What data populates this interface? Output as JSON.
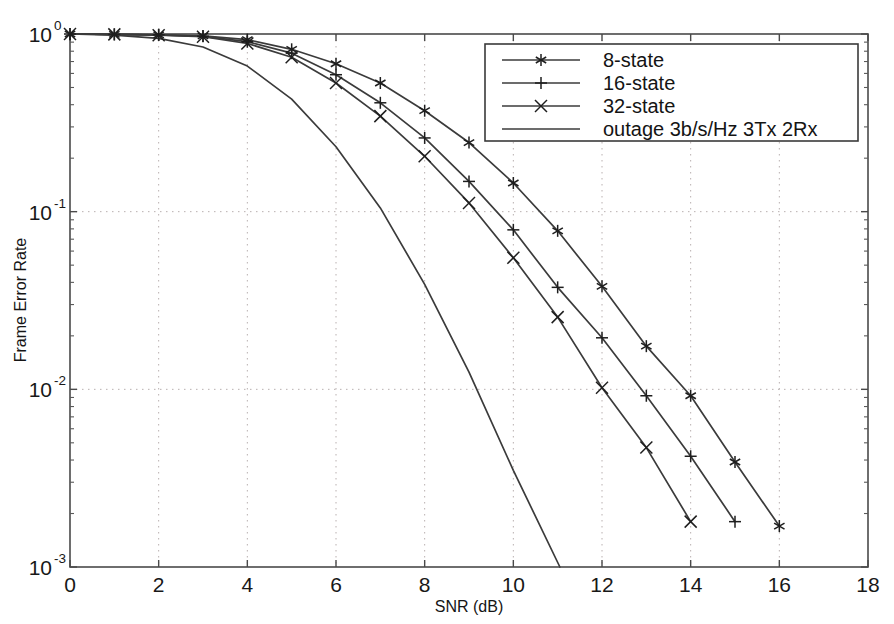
{
  "chart_data": {
    "type": "line",
    "title": "",
    "xlabel": "SNR (dB)",
    "ylabel": "Frame Error Rate",
    "xlim": [
      0,
      18
    ],
    "ylim": [
      0.001,
      1
    ],
    "yscale": "log",
    "grid": true,
    "legend_position": "upper right",
    "xticks": [
      0,
      2,
      4,
      6,
      8,
      10,
      12,
      14,
      16,
      18
    ],
    "xticklabels": [
      "0",
      "2",
      "4",
      "6",
      "8",
      "10",
      "12",
      "14",
      "16",
      "18"
    ],
    "yticks": [
      1,
      0.1,
      0.01,
      0.001
    ],
    "yticklabels": [
      "10^0",
      "10^-1",
      "10^-2",
      "10^-3"
    ],
    "ytick_mantissa": [
      "10",
      "10",
      "10",
      "10"
    ],
    "ytick_exponent": [
      "0",
      "-1",
      "-2",
      "-3"
    ],
    "series": [
      {
        "name": "8-state",
        "marker": "asterisk",
        "x": [
          0,
          1,
          2,
          3,
          4,
          5,
          6,
          7,
          8,
          9,
          10,
          11,
          12,
          13,
          14,
          15,
          16
        ],
        "values": [
          1.0,
          0.995,
          0.99,
          0.975,
          0.93,
          0.82,
          0.68,
          0.53,
          0.37,
          0.245,
          0.145,
          0.078,
          0.038,
          0.0175,
          0.0092,
          0.0039,
          0.0017
        ]
      },
      {
        "name": "16-state",
        "marker": "plus",
        "x": [
          0,
          1,
          2,
          3,
          4,
          5,
          6,
          7,
          8,
          9,
          10,
          11,
          12,
          13,
          14,
          15
        ],
        "values": [
          1.0,
          0.995,
          0.99,
          0.97,
          0.905,
          0.78,
          0.59,
          0.41,
          0.26,
          0.148,
          0.079,
          0.0375,
          0.0195,
          0.0092,
          0.0042,
          0.0018
        ]
      },
      {
        "name": "32-state",
        "marker": "cross",
        "x": [
          0,
          1,
          2,
          3,
          4,
          5,
          6,
          7,
          8,
          9,
          10,
          11,
          12,
          13,
          14
        ],
        "values": [
          1.0,
          0.995,
          0.985,
          0.965,
          0.885,
          0.74,
          0.53,
          0.345,
          0.205,
          0.112,
          0.055,
          0.0255,
          0.0102,
          0.0047,
          0.0018
        ]
      },
      {
        "name": "outage 3b/s/Hz 3Tx 2Rx",
        "marker": "none",
        "x": [
          0,
          1,
          2,
          3,
          4,
          5,
          6,
          7,
          8,
          9,
          10,
          11.05
        ],
        "values": [
          1.0,
          0.985,
          0.945,
          0.845,
          0.66,
          0.43,
          0.232,
          0.105,
          0.039,
          0.0125,
          0.0035,
          0.001
        ]
      }
    ]
  },
  "legend": {
    "entries": [
      {
        "label": "8-state"
      },
      {
        "label": "16-state"
      },
      {
        "label": "32-state"
      },
      {
        "label": "outage 3b/s/Hz 3Tx 2Rx"
      }
    ]
  }
}
